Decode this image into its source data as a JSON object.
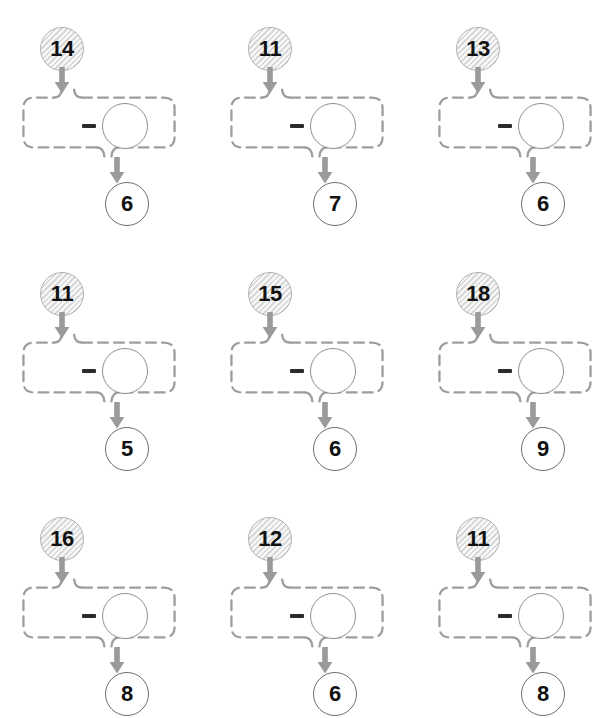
{
  "worksheet": {
    "title": "Subtraction Function Machines",
    "operator_symbol": "-",
    "operator_name": "minus-sign",
    "background_color": "#ffffff",
    "input_bubble_fill": "#e6e6e6",
    "input_bubble_border": "#b3b3b3",
    "box_border_color": "#9e9e9e",
    "arrow_color": "#9a9a9a",
    "result_bubble_border": "#6e6e6e",
    "number_color": "#111111",
    "grid": {
      "columns": 3,
      "rows": 3
    },
    "blank_answer_value": ""
  },
  "problems": [
    {
      "index": 1,
      "input": "14",
      "operator": "-",
      "missing": "",
      "result": "6"
    },
    {
      "index": 2,
      "input": "11",
      "operator": "-",
      "missing": "",
      "result": "7"
    },
    {
      "index": 3,
      "input": "13",
      "operator": "-",
      "missing": "",
      "result": "6"
    },
    {
      "index": 4,
      "input": "11",
      "operator": "-",
      "missing": "",
      "result": "5"
    },
    {
      "index": 5,
      "input": "15",
      "operator": "-",
      "missing": "",
      "result": "6"
    },
    {
      "index": 6,
      "input": "18",
      "operator": "-",
      "missing": "",
      "result": "9"
    },
    {
      "index": 7,
      "input": "16",
      "operator": "-",
      "missing": "",
      "result": "8"
    },
    {
      "index": 8,
      "input": "12",
      "operator": "-",
      "missing": "",
      "result": "6"
    },
    {
      "index": 9,
      "input": "11",
      "operator": "-",
      "missing": "",
      "result": "8"
    }
  ],
  "layout": {
    "origins": [
      {
        "x": 4,
        "y": 27
      },
      {
        "x": 212,
        "y": 27
      },
      {
        "x": 420,
        "y": 27
      },
      {
        "x": 4,
        "y": 272
      },
      {
        "x": 212,
        "y": 272
      },
      {
        "x": 420,
        "y": 272
      },
      {
        "x": 4,
        "y": 517
      },
      {
        "x": 212,
        "y": 517
      },
      {
        "x": 420,
        "y": 517
      }
    ]
  }
}
